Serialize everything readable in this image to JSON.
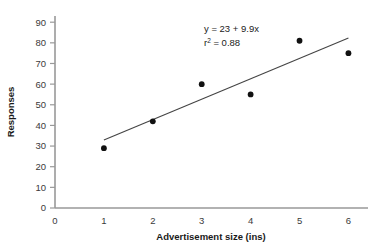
{
  "chart_data": {
    "type": "scatter",
    "title": "",
    "xlabel": "Advertisement size (ins)",
    "ylabel": "Responses",
    "xlim": [
      0,
      6.4
    ],
    "ylim": [
      0,
      93
    ],
    "grid": false,
    "legend": "none",
    "x": [
      1,
      2,
      3,
      4,
      5,
      6
    ],
    "values": [
      29,
      42,
      60,
      55,
      81,
      75
    ],
    "series": [
      {
        "name": "Responses",
        "x": [
          1,
          2,
          3,
          4,
          5,
          6
        ],
        "values": [
          29,
          42,
          60,
          55,
          81,
          75
        ],
        "marker": "filled-circle",
        "color": "#111111"
      },
      {
        "name": "Regression line",
        "type": "line",
        "x": [
          1,
          6
        ],
        "values": [
          32.9,
          82.4
        ],
        "color": "#444444"
      }
    ],
    "xticks": [
      0,
      1,
      2,
      3,
      4,
      5,
      6
    ],
    "xtick_labels": [
      "0",
      "1",
      "2",
      "3",
      "4",
      "5",
      "6"
    ],
    "yticks": [
      0,
      10,
      20,
      30,
      40,
      50,
      60,
      70,
      80,
      90
    ],
    "ytick_labels": [
      "0",
      "10",
      "20",
      "30",
      "40",
      "50",
      "60",
      "70",
      "80",
      "90"
    ],
    "annotations": [
      {
        "name": "regression-equation",
        "text": "y = 23 + 9.9x",
        "x": 2.9,
        "y": 86
      },
      {
        "name": "r-squared",
        "base": "r",
        "sup": "2",
        "rest": " = 0.88",
        "x": 2.9,
        "y": 80
      }
    ],
    "fit": {
      "intercept": 23,
      "slope": 9.9,
      "r_squared": 0.88,
      "equation_text": "y = 23 + 9.9x",
      "r_squared_text": "r² = 0.88"
    },
    "colors": {
      "axis": "#999999",
      "marker": "#111111",
      "line": "#444444",
      "text": "#1a1a1a",
      "background": "#ffffff"
    }
  }
}
